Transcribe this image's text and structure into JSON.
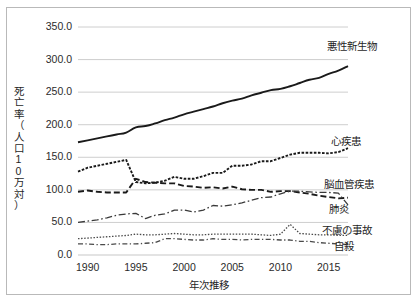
{
  "chart_data": {
    "type": "line",
    "title": "",
    "xlabel": "年次推移",
    "ylabel": "死亡率（人口10万対）",
    "ylabel_chars": [
      "死",
      "亡",
      "率",
      "（",
      "人",
      "口",
      "1",
      "0",
      "万",
      "対",
      "）"
    ],
    "xlim": [
      1989,
      2017
    ],
    "ylim": [
      0,
      350
    ],
    "grid": true,
    "legend_position": "right-inline",
    "yticks": [
      "0.0",
      "50.0",
      "100.0",
      "150.0",
      "200.0",
      "250.0",
      "300.0",
      "350.0"
    ],
    "ytick_values": [
      0,
      50,
      100,
      150,
      200,
      250,
      300,
      350
    ],
    "xticks": [
      "1990",
      "1995",
      "2000",
      "2005",
      "2010",
      "2015"
    ],
    "xtick_values": [
      1990,
      1995,
      2000,
      2005,
      2010,
      2015
    ],
    "x": [
      1989,
      1990,
      1991,
      1992,
      1993,
      1994,
      1995,
      1996,
      1997,
      1998,
      1999,
      2000,
      2001,
      2002,
      2003,
      2004,
      2005,
      2006,
      2007,
      2008,
      2009,
      2010,
      2011,
      2012,
      2013,
      2014,
      2015,
      2016,
      2017
    ],
    "series": [
      {
        "name": "悪性新生物",
        "style": "solid",
        "color": "#1a1a1a",
        "width": 1.9,
        "label_x": 2014.2,
        "label_y": 322,
        "values": [
          173,
          176,
          179,
          182,
          185,
          188,
          196,
          198,
          202,
          207,
          211,
          216,
          220,
          224,
          228,
          233,
          237,
          240,
          245,
          249,
          253,
          255,
          259,
          264,
          269,
          272,
          278,
          283,
          290
        ]
      },
      {
        "name": "心疾患",
        "style": "dotted",
        "color": "#1a1a1a",
        "width": 1.9,
        "label_x": 2014.6,
        "label_y": 176,
        "values": [
          128,
          134,
          137,
          140,
          143,
          146,
          112,
          110,
          111,
          114,
          120,
          117,
          117,
          121,
          126,
          126,
          137,
          137,
          139,
          144,
          144,
          149,
          154,
          157,
          157,
          157,
          156,
          158,
          164
        ]
      },
      {
        "name": "脳血管疾患",
        "style": "dashed",
        "color": "#1a1a1a",
        "width": 1.9,
        "label_x": 2013.9,
        "label_y": 110,
        "values": [
          97,
          99,
          97,
          96,
          96,
          96,
          117,
          112,
          111,
          110,
          110,
          106,
          105,
          103,
          104,
          102,
          105,
          101,
          100,
          100,
          97,
          98,
          98,
          96,
          94,
          91,
          89,
          87,
          88
        ]
      },
      {
        "name": "肺炎",
        "style": "dashdot",
        "color": "#3a3a3a",
        "width": 1.3,
        "label_x": 2014.4,
        "label_y": 72,
        "values": [
          50,
          52,
          54,
          57,
          61,
          63,
          64,
          56,
          61,
          63,
          69,
          69,
          66,
          69,
          76,
          75,
          77,
          80,
          84,
          88,
          89,
          94,
          98,
          98,
          97,
          96,
          96,
          95,
          77
        ]
      },
      {
        "name": "不慮の事故",
        "style": "dotfine",
        "color": "#4a4a4a",
        "width": 1.3,
        "label_x": 2013.7,
        "label_y": 40,
        "values": [
          25,
          26,
          27,
          28,
          29,
          30,
          32,
          31,
          31,
          32,
          33,
          32,
          31,
          31,
          32,
          32,
          32,
          32,
          32,
          31,
          30,
          32,
          47,
          33,
          32,
          31,
          31,
          30,
          30
        ]
      },
      {
        "name": "自殺",
        "style": "dashdotfine",
        "color": "#4a4a4a",
        "width": 1.3,
        "label_x": 2014.9,
        "label_y": 16,
        "values": [
          17,
          17,
          16,
          16,
          17,
          17,
          17,
          18,
          19,
          25,
          25,
          24,
          23,
          23,
          25,
          24,
          24,
          23,
          24,
          24,
          24,
          23,
          23,
          21,
          21,
          19,
          18,
          17,
          16
        ]
      }
    ]
  }
}
